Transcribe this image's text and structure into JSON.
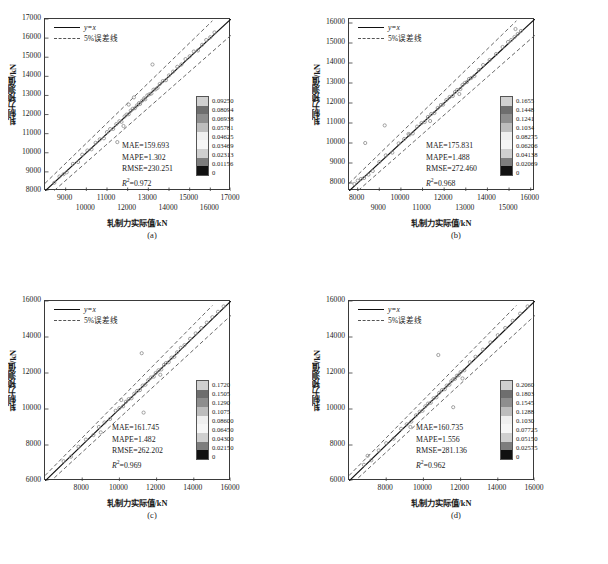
{
  "figure": {
    "axis_labels": {
      "x": "轧制力实际值/kN",
      "y": "轧制力预测值/kN"
    },
    "legend": {
      "line_label": "y=x",
      "band_label": "5%误差线"
    },
    "colors": {
      "identity_line": "#111111",
      "error_band": "#555555",
      "axis": "#3a3a3a",
      "point": "#8a8a8a"
    }
  },
  "chart_data": [
    {
      "type": "scatter",
      "panel": "(a)",
      "title": "",
      "xlabel": "轧制力实际值/kN",
      "ylabel": "轧制力预测值/kN",
      "xlim": [
        8000,
        17000
      ],
      "ylim": [
        8000,
        17000
      ],
      "xticks": [
        9000,
        10000,
        11000,
        12000,
        13000,
        14000,
        15000,
        16000,
        17000
      ],
      "xticklabels_top": [
        "9000",
        "11000",
        "13000",
        "15000",
        "17000"
      ],
      "xticklabels_bottom": [
        "10000",
        "12000",
        "14000",
        "16000"
      ],
      "yticks": [
        8000,
        9000,
        10000,
        11000,
        12000,
        13000,
        14000,
        15000,
        16000,
        17000
      ],
      "yticklabels": [
        "8000",
        "9000",
        "10000",
        "11000",
        "12000",
        "13000",
        "14000",
        "15000",
        "16000",
        "17000"
      ],
      "grid": false,
      "legend_position": "upper-left",
      "identity_line": "y=x",
      "error_band_percent": 5,
      "metrics": {
        "MAE": "MAE=159.693",
        "MAPE": "MAPE=1.302",
        "RMSE": "RMSE=230.251",
        "R2_prefix": "R",
        "R2_sup": "2",
        "R2_value": "=0.972"
      },
      "colorbar": {
        "ticklabels": [
          "0.09250",
          "0.08094",
          "0.06938",
          "0.05781",
          "0.04625",
          "0.03469",
          "0.02313",
          "0.01156",
          "0"
        ],
        "max": 0.0925,
        "min": 0
      },
      "points": [
        [
          8450,
          8430
        ],
        [
          8700,
          8760
        ],
        [
          8900,
          8880
        ],
        [
          9050,
          8980
        ],
        [
          9350,
          9420
        ],
        [
          9600,
          9520
        ],
        [
          9800,
          9900
        ],
        [
          10050,
          10120
        ],
        [
          10250,
          10180
        ],
        [
          10450,
          10520
        ],
        [
          10650,
          10700
        ],
        [
          10850,
          10760
        ],
        [
          11000,
          11080
        ],
        [
          11150,
          11240
        ],
        [
          11300,
          11250
        ],
        [
          11450,
          11500
        ],
        [
          11600,
          11650
        ],
        [
          11700,
          11620
        ],
        [
          11850,
          11900
        ],
        [
          11950,
          12000
        ],
        [
          12050,
          12020
        ],
        [
          12150,
          12200
        ],
        [
          12250,
          12300
        ],
        [
          12350,
          12330
        ],
        [
          12450,
          12480
        ],
        [
          12550,
          12600
        ],
        [
          12600,
          12560
        ],
        [
          12700,
          12720
        ],
        [
          12800,
          12850
        ],
        [
          12850,
          12800
        ],
        [
          12950,
          13000
        ],
        [
          13050,
          13060
        ],
        [
          13150,
          13100
        ],
        [
          13250,
          13300
        ],
        [
          13350,
          13320
        ],
        [
          13450,
          13400
        ],
        [
          13550,
          13600
        ],
        [
          13700,
          13750
        ],
        [
          13850,
          13800
        ],
        [
          14000,
          14050
        ],
        [
          14200,
          14250
        ],
        [
          14400,
          14500
        ],
        [
          14600,
          14620
        ],
        [
          14800,
          14900
        ],
        [
          15000,
          15050
        ],
        [
          15200,
          15300
        ],
        [
          15400,
          15350
        ],
        [
          15600,
          15650
        ],
        [
          15800,
          15900
        ],
        [
          16000,
          16050
        ],
        [
          16200,
          16300
        ],
        [
          13200,
          14620
        ],
        [
          11500,
          10560
        ],
        [
          12050,
          12520
        ],
        [
          12300,
          12900
        ],
        [
          11800,
          11400
        ]
      ]
    },
    {
      "type": "scatter",
      "panel": "(b)",
      "title": "",
      "xlabel": "轧制力实际值/kN",
      "ylabel": "轧制力预测值/kN",
      "xlim": [
        7600,
        16200
      ],
      "ylim": [
        7600,
        16200
      ],
      "xticks": [
        8000,
        9000,
        10000,
        11000,
        12000,
        13000,
        14000,
        15000,
        16000
      ],
      "xticklabels_top": [
        "8000",
        "10000",
        "12000",
        "14000",
        "16000"
      ],
      "xticklabels_bottom": [
        "9000",
        "11000",
        "13000",
        "15000"
      ],
      "yticks": [
        8000,
        9000,
        10000,
        11000,
        12000,
        13000,
        14000,
        15000,
        16000
      ],
      "yticklabels": [
        "8000",
        "9000",
        "10000",
        "11000",
        "12000",
        "13000",
        "14000",
        "15000",
        "16000"
      ],
      "grid": false,
      "legend_position": "upper-left",
      "identity_line": "y=x",
      "error_band_percent": 5,
      "metrics": {
        "MAE": "MAE=175.831",
        "MAPE": "MAPE=1.488",
        "RMSE": "RMSE=272.460",
        "R2_prefix": "R",
        "R2_sup": "2",
        "R2_value": "=0.968"
      },
      "colorbar": {
        "ticklabels": [
          "0.1655",
          "0.1448",
          "0.1241",
          "0.1034",
          "0.08275",
          "0.06206",
          "0.04138",
          "0.02069",
          "0"
        ],
        "max": 0.1655,
        "min": 0
      },
      "points": [
        [
          7850,
          7950
        ],
        [
          8000,
          8120
        ],
        [
          8150,
          8200
        ],
        [
          8300,
          8250
        ],
        [
          8500,
          8420
        ],
        [
          8700,
          8600
        ],
        [
          9000,
          9050
        ],
        [
          9300,
          9380
        ],
        [
          9600,
          9520
        ],
        [
          9900,
          9980
        ],
        [
          10150,
          10200
        ],
        [
          10350,
          10450
        ],
        [
          10550,
          10480
        ],
        [
          10750,
          10820
        ],
        [
          10950,
          11000
        ],
        [
          11100,
          11050
        ],
        [
          11250,
          11300
        ],
        [
          11400,
          11450
        ],
        [
          11550,
          11500
        ],
        [
          11700,
          11750
        ],
        [
          11850,
          11900
        ],
        [
          11950,
          11920
        ],
        [
          12100,
          12150
        ],
        [
          12250,
          12300
        ],
        [
          12400,
          12350
        ],
        [
          12500,
          12550
        ],
        [
          12600,
          12650
        ],
        [
          12750,
          12700
        ],
        [
          12850,
          12900
        ],
        [
          12950,
          13000
        ],
        [
          13050,
          13050
        ],
        [
          13150,
          13200
        ],
        [
          13250,
          13250
        ],
        [
          13400,
          13350
        ],
        [
          13600,
          13650
        ],
        [
          13800,
          13900
        ],
        [
          14100,
          14150
        ],
        [
          14400,
          14450
        ],
        [
          14700,
          14800
        ],
        [
          14950,
          15050
        ],
        [
          15100,
          15150
        ],
        [
          15250,
          15300
        ],
        [
          15400,
          15450
        ],
        [
          15550,
          15600
        ],
        [
          15300,
          15700
        ],
        [
          8350,
          10000
        ],
        [
          9250,
          10880
        ],
        [
          10400,
          10420
        ],
        [
          12700,
          12450
        ],
        [
          11350,
          11100
        ]
      ]
    },
    {
      "type": "scatter",
      "panel": "(c)",
      "title": "",
      "xlabel": "轧制力实际值/kN",
      "ylabel": "轧制力预测值/kN",
      "xlim": [
        6000,
        16000
      ],
      "ylim": [
        6000,
        16000
      ],
      "xticks": [
        8000,
        10000,
        12000,
        14000,
        16000
      ],
      "xticklabels_top": [
        "8000",
        "10000",
        "12000",
        "14000",
        "16000"
      ],
      "xticklabels_bottom": [],
      "yticks": [
        6000,
        8000,
        10000,
        12000,
        14000,
        16000
      ],
      "yticklabels": [
        "6000",
        "8000",
        "10000",
        "12000",
        "14000",
        "16000"
      ],
      "grid": false,
      "legend_position": "upper-left",
      "identity_line": "y=x",
      "error_band_percent": 5,
      "metrics": {
        "MAE": "MAE=161.745",
        "MAPE": "MAPE=1.482",
        "RMSE": "RMSE=262.202",
        "R2_prefix": "R",
        "R2_sup": "2",
        "R2_value": "=0.969"
      },
      "colorbar": {
        "ticklabels": [
          "0.1720",
          "0.1505",
          "0.1290",
          "0.1075",
          "0.08600",
          "0.06450",
          "0.04300",
          "0.02150",
          "0"
        ],
        "max": 0.172,
        "min": 0
      },
      "points": [
        [
          7000,
          7100
        ],
        [
          7400,
          7350
        ],
        [
          7800,
          7900
        ],
        [
          8200,
          8300
        ],
        [
          8600,
          8550
        ],
        [
          8900,
          9000
        ],
        [
          9200,
          9250
        ],
        [
          9500,
          9450
        ],
        [
          9800,
          9900
        ],
        [
          10000,
          10050
        ],
        [
          10200,
          10150
        ],
        [
          10350,
          10400
        ],
        [
          10500,
          10550
        ],
        [
          10650,
          10600
        ],
        [
          10800,
          10850
        ],
        [
          10950,
          11000
        ],
        [
          11100,
          11050
        ],
        [
          11250,
          11300
        ],
        [
          11400,
          11350
        ],
        [
          11550,
          11600
        ],
        [
          11700,
          11750
        ],
        [
          11850,
          11800
        ],
        [
          11950,
          12000
        ],
        [
          12100,
          12150
        ],
        [
          12250,
          12200
        ],
        [
          12400,
          12450
        ],
        [
          12500,
          12550
        ],
        [
          12650,
          12600
        ],
        [
          12800,
          12850
        ],
        [
          12950,
          12900
        ],
        [
          13100,
          13150
        ],
        [
          13300,
          13400
        ],
        [
          13500,
          13550
        ],
        [
          13800,
          13900
        ],
        [
          14100,
          14200
        ],
        [
          14400,
          14500
        ],
        [
          14700,
          14800
        ],
        [
          15000,
          15100
        ],
        [
          15300,
          15400
        ],
        [
          15600,
          15700
        ],
        [
          11200,
          13100
        ],
        [
          11300,
          9800
        ],
        [
          10100,
          10500
        ],
        [
          12200,
          11900
        ],
        [
          9000,
          8700
        ]
      ]
    },
    {
      "type": "scatter",
      "panel": "(d)",
      "title": "",
      "xlabel": "轧制力实际值/kN",
      "ylabel": "轧制力预测值/kN",
      "xlim": [
        6000,
        16000
      ],
      "ylim": [
        6000,
        16000
      ],
      "xticks": [
        8000,
        10000,
        12000,
        14000,
        16000
      ],
      "xticklabels_top": [
        "8000",
        "10000",
        "12000",
        "14000",
        "16000"
      ],
      "xticklabels_bottom": [],
      "yticks": [
        6000,
        8000,
        10000,
        12000,
        14000,
        16000
      ],
      "yticklabels": [
        "6000",
        "8000",
        "10000",
        "12000",
        "14000",
        "16000"
      ],
      "grid": false,
      "legend_position": "upper-left",
      "identity_line": "y=x",
      "error_band_percent": 5,
      "metrics": {
        "MAE": "MAE=160.735",
        "MAPE": "MAPE=1.556",
        "RMSE": "RMSE=281.136",
        "R2_prefix": "R",
        "R2_sup": "2",
        "R2_value": "=0.962"
      },
      "colorbar": {
        "ticklabels": [
          "0.2060",
          "0.1803",
          "0.1545",
          "0.1288",
          "0.1030",
          "0.07725",
          "0.05150",
          "0.02575",
          "0"
        ],
        "max": 0.206,
        "min": 0
      },
      "points": [
        [
          6800,
          6900
        ],
        [
          7200,
          7150
        ],
        [
          7600,
          7700
        ],
        [
          8000,
          8100
        ],
        [
          8400,
          8350
        ],
        [
          8800,
          8900
        ],
        [
          9100,
          9150
        ],
        [
          9350,
          9300
        ],
        [
          9600,
          9650
        ],
        [
          9800,
          9850
        ],
        [
          9950,
          9900
        ],
        [
          10100,
          10150
        ],
        [
          10250,
          10300
        ],
        [
          10400,
          10350
        ],
        [
          10550,
          10600
        ],
        [
          10700,
          10650
        ],
        [
          10850,
          10900
        ],
        [
          11000,
          11050
        ],
        [
          11150,
          11100
        ],
        [
          11250,
          11300
        ],
        [
          11400,
          11350
        ],
        [
          11500,
          11550
        ],
        [
          11600,
          11650
        ],
        [
          11700,
          11680
        ],
        [
          11800,
          11850
        ],
        [
          11900,
          11880
        ],
        [
          12000,
          12050
        ],
        [
          12200,
          12150
        ],
        [
          12500,
          12600
        ],
        [
          12800,
          12900
        ],
        [
          13200,
          13300
        ],
        [
          13600,
          13700
        ],
        [
          14000,
          14100
        ],
        [
          14400,
          14500
        ],
        [
          14800,
          14900
        ],
        [
          15200,
          15300
        ],
        [
          15600,
          15700
        ],
        [
          10800,
          13000
        ],
        [
          11600,
          10100
        ],
        [
          7000,
          7400
        ],
        [
          9300,
          9000
        ],
        [
          12100,
          11700
        ]
      ]
    }
  ]
}
